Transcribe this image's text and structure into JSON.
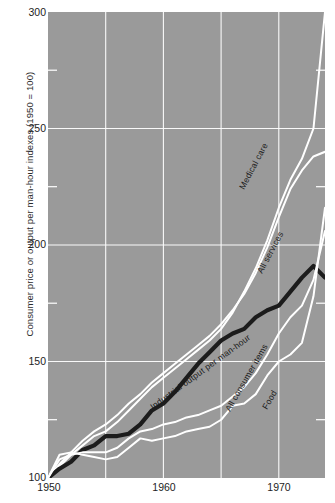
{
  "chart_data": {
    "type": "line",
    "title": "",
    "subtitle": "",
    "xlabel": "",
    "ylabel": "Consumer price or output per man-hour indexes (1950 = 100)",
    "xlim": [
      1950,
      1974
    ],
    "ylim": [
      100,
      300
    ],
    "xticks": [
      1950,
      1960,
      1970
    ],
    "xticklabels": [
      "1950",
      "1960",
      "1970"
    ],
    "yticks": [
      100,
      150,
      200,
      250,
      300
    ],
    "yticklabels": [
      "100",
      "150",
      "200",
      "250",
      "300"
    ],
    "y_minor_ticks": [
      125,
      175,
      225,
      275
    ],
    "grid": "major gridlines, white, x every 5 years, y every 50 units",
    "legend": "inline curve labels rotated along each line",
    "background_color": "#9a9a9a",
    "line_color_light": "#ffffff",
    "line_color_bold": "#1c1c1c",
    "series": [
      {
        "name": "Medical care",
        "label": "Medical care",
        "color": "#ffffff",
        "style": "thin white line",
        "x": [
          1950,
          1951,
          1952,
          1953,
          1954,
          1955,
          1956,
          1957,
          1958,
          1959,
          1960,
          1961,
          1962,
          1963,
          1964,
          1965,
          1966,
          1967,
          1968,
          1969,
          1970,
          1971,
          1972,
          1973,
          1974
        ],
        "values": [
          100,
          105,
          110,
          114,
          118,
          120,
          124,
          129,
          134,
          139,
          143,
          147,
          151,
          155,
          159,
          164,
          171,
          180,
          190,
          202,
          216,
          228,
          237,
          250,
          300
        ]
      },
      {
        "name": "All services",
        "label": "All services",
        "color": "#ffffff",
        "style": "thin white line",
        "x": [
          1950,
          1951,
          1952,
          1953,
          1954,
          1955,
          1956,
          1957,
          1958,
          1959,
          1960,
          1961,
          1962,
          1963,
          1964,
          1965,
          1966,
          1967,
          1968,
          1969,
          1970,
          1971,
          1972,
          1973,
          1974
        ],
        "values": [
          100,
          106,
          111,
          116,
          120,
          123,
          127,
          132,
          136,
          141,
          145,
          149,
          153,
          157,
          161,
          166,
          172,
          179,
          188,
          199,
          212,
          224,
          232,
          238,
          240
        ]
      },
      {
        "name": "Industrial output per man-hour",
        "label": "Industrial output per man-hour",
        "color": "#1c1c1c",
        "style": "thick dark line",
        "x": [
          1950,
          1951,
          1952,
          1953,
          1954,
          1955,
          1956,
          1957,
          1958,
          1959,
          1960,
          1961,
          1962,
          1963,
          1964,
          1965,
          1966,
          1967,
          1968,
          1969,
          1970,
          1971,
          1972,
          1973,
          1974
        ],
        "values": [
          100,
          104,
          107,
          112,
          114,
          118,
          118,
          119,
          123,
          129,
          132,
          137,
          143,
          149,
          154,
          159,
          162,
          164,
          169,
          172,
          174,
          180,
          186,
          191,
          186
        ]
      },
      {
        "name": "All consumer items",
        "label": "All consumer items",
        "color": "#ffffff",
        "style": "thin white line",
        "x": [
          1950,
          1951,
          1952,
          1953,
          1954,
          1955,
          1956,
          1957,
          1958,
          1959,
          1960,
          1961,
          1962,
          1963,
          1964,
          1965,
          1966,
          1967,
          1968,
          1969,
          1970,
          1971,
          1972,
          1973,
          1974
        ],
        "values": [
          100,
          108,
          110,
          111,
          111,
          111,
          113,
          117,
          120,
          121,
          123,
          124,
          126,
          127,
          129,
          131,
          135,
          139,
          145,
          153,
          162,
          169,
          174,
          185,
          206
        ]
      },
      {
        "name": "Food",
        "label": "Food",
        "color": "#ffffff",
        "style": "thin white line",
        "x": [
          1950,
          1951,
          1952,
          1953,
          1954,
          1955,
          1956,
          1957,
          1958,
          1959,
          1960,
          1961,
          1962,
          1963,
          1964,
          1965,
          1966,
          1967,
          1968,
          1969,
          1970,
          1971,
          1972,
          1973,
          1974
        ],
        "values": [
          100,
          110,
          111,
          110,
          109,
          108,
          109,
          113,
          117,
          116,
          117,
          118,
          120,
          121,
          122,
          125,
          131,
          132,
          136,
          144,
          150,
          153,
          158,
          178,
          216
        ]
      }
    ]
  }
}
